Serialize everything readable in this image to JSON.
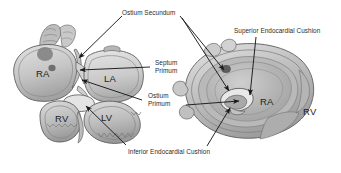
{
  "figure": {
    "background_color": "#ffffff",
    "label_color": "#2b2b2b",
    "leader_color": "#1a1a1a",
    "tissue_fill_light": "#d8d8d8",
    "tissue_fill_mid": "#b4b4b4",
    "tissue_fill_dark": "#8e8e8e",
    "outline_color": "#5a5a5a"
  },
  "callouts": [
    {
      "id": "ostium-secundum",
      "text": "Ostium Secundum",
      "line1": "Ostium Secundum",
      "line2": ""
    },
    {
      "id": "superior-endocardial-cushion",
      "text": "Superior Endocardial Cushion",
      "line1": "Superior Endocardial Cushion",
      "line2": ""
    },
    {
      "id": "septum-primum",
      "text": "Septum Primum",
      "line1": "Septum",
      "line2": "Primum"
    },
    {
      "id": "ostium-primum",
      "text": "Ostium Primum",
      "line1": "Ostium",
      "line2": "Primum"
    },
    {
      "id": "inferior-endocardial-cushion",
      "text": "Inferior Endocardial Cushion",
      "line1": "Inferior Endocardial Cushion",
      "line2": ""
    }
  ],
  "chambers": {
    "left_panel": [
      {
        "id": "ra-left",
        "label": "RA"
      },
      {
        "id": "la-left",
        "label": "LA"
      },
      {
        "id": "rv-left",
        "label": "RV"
      },
      {
        "id": "lv-left",
        "label": "LV"
      }
    ],
    "right_panel": [
      {
        "id": "ra-right",
        "label": "RA"
      },
      {
        "id": "rv-right",
        "label": "RV"
      }
    ]
  }
}
